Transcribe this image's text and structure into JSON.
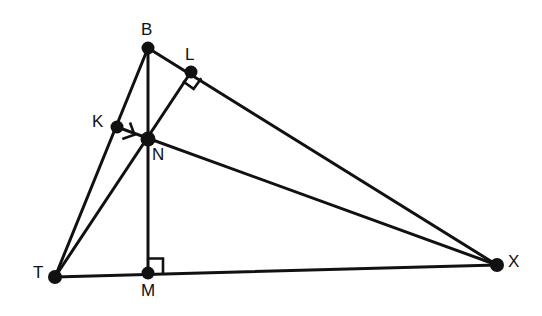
{
  "figure": {
    "background_color": "#ffffff",
    "stroke_color": "#111111",
    "width": 542,
    "height": 316
  },
  "points": [
    {
      "id": "B",
      "label": "B",
      "x": 148,
      "y": 48,
      "label_x": 141,
      "label_y": 21,
      "dot_r": 6.5
    },
    {
      "id": "L",
      "label": "L",
      "x": 191,
      "y": 72,
      "label_x": 185,
      "label_y": 46,
      "dot_r": 6.5
    },
    {
      "id": "K",
      "label": "K",
      "x": 117,
      "y": 127,
      "label_x": 92,
      "label_y": 113,
      "dot_r": 6.5
    },
    {
      "id": "N",
      "label": "N",
      "x": 148,
      "y": 139,
      "label_x": 152,
      "label_y": 146,
      "dot_r": 7.5
    },
    {
      "id": "T",
      "label": "T",
      "x": 55,
      "y": 277,
      "label_x": 33,
      "label_y": 264,
      "dot_r": 7.0
    },
    {
      "id": "M",
      "label": "M",
      "x": 148,
      "y": 273,
      "label_x": 141,
      "label_y": 282,
      "dot_r": 6.5
    },
    {
      "id": "X",
      "label": "X",
      "x": 497,
      "y": 265,
      "label_x": 508,
      "label_y": 253,
      "dot_r": 7.0
    }
  ],
  "segments": [
    {
      "id": "T-B",
      "from": "T",
      "to": "B",
      "note": "side TB passing through K"
    },
    {
      "id": "B-X",
      "from": "B",
      "to": "X",
      "note": "side BX passing through L"
    },
    {
      "id": "T-X",
      "from": "T",
      "to": "X",
      "note": "base TX passing through M"
    },
    {
      "id": "B-M",
      "from": "B",
      "to": "M",
      "note": "altitude from B to TX through N"
    },
    {
      "id": "T-L",
      "from": "T",
      "to": "L",
      "note": "altitude from T to BX through N"
    },
    {
      "id": "X-K",
      "from": "X",
      "to": "K",
      "note": "altitude from X to TB through N"
    }
  ],
  "right_angles": [
    {
      "id": "right-angle-at-K",
      "at": "K",
      "size": 13,
      "marks": "TB perpendicular to XK"
    },
    {
      "id": "right-angle-at-L",
      "at": "L",
      "size": 13,
      "marks": "BX perpendicular to TL"
    },
    {
      "id": "right-angle-at-M",
      "at": "M",
      "size": 13,
      "marks": "TX perpendicular to BM"
    }
  ],
  "labels": {
    "B": "B",
    "L": "L",
    "K": "K",
    "N": "N",
    "T": "T",
    "M": "M",
    "X": "X"
  }
}
